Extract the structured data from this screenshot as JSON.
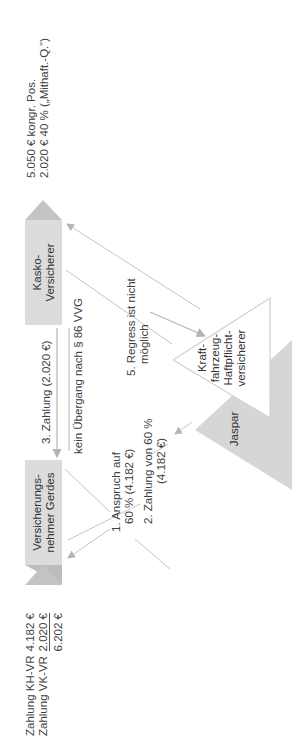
{
  "summary": {
    "rows": [
      {
        "label": "Zahlung KH-VR",
        "value": "4.182 €"
      },
      {
        "label": "Zahlung VK-VR",
        "value": "2.020 €"
      }
    ],
    "total": "6.202 €"
  },
  "nodes": {
    "gerdes": {
      "line1": "Versicherungs-",
      "line2": "nehmer Gerdes"
    },
    "kasko": {
      "line1": "Kasko-",
      "line2": "Versicherer"
    },
    "kfz": {
      "line1": "Kraft-",
      "line2": "fahrzeug-",
      "line3": "Haftpflicht-",
      "line4": "versicherer"
    },
    "jaspar": {
      "label": "Jaspar"
    }
  },
  "flows": {
    "step1": {
      "line1": "1. Anspruch auf",
      "line2": "60 % (4.182 €)"
    },
    "step2": {
      "line1": "2. Zahlung von 60 %",
      "line2": "(4.182 €)"
    },
    "step3": {
      "label": "3. Zahlung (2.020 €)"
    },
    "no_transfer": {
      "label": "kein Übergang nach § 86 VVG"
    },
    "step5": {
      "line1": "5. Regress ist nicht",
      "line2": "möglich"
    }
  },
  "notes": {
    "line1": "5.050 € kongr. Pos.",
    "line2": "2.020 € 40 % („Mithaft.-Q.“)"
  },
  "colors": {
    "box": "#dcdcdc",
    "triangle": "#c8c8c8",
    "line": "#bdbdbd"
  }
}
